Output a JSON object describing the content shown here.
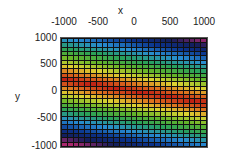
{
  "chart_data": {
    "type": "heatmap",
    "title": "",
    "xlabel": "x",
    "ylabel": "y",
    "xlim": [
      -1000,
      1000
    ],
    "ylim": [
      -1000,
      1000
    ],
    "x_ticks": [
      "-1000",
      "-500",
      "0",
      "500",
      "1000"
    ],
    "y_ticks": [
      "1000",
      "500",
      "0",
      "-500",
      "-1000"
    ],
    "x_axis_position": "top",
    "grid_size": [
      25,
      25
    ],
    "colormap": "jet-like (red high ridge, yellow, green, cyan, blue, wraps to magenta at corners)",
    "ridge": {
      "y_at_x_min": 250,
      "y_at_x_max": -200
    },
    "legend": null,
    "grid": true
  },
  "labels": {
    "x_axis_label": "x",
    "y_axis_label": "y"
  }
}
